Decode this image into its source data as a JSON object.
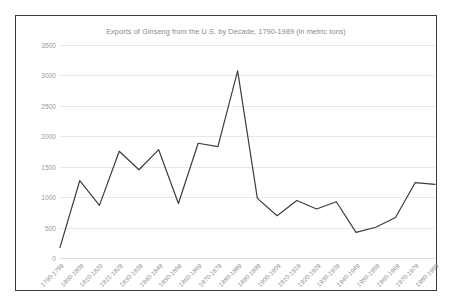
{
  "chart_data": {
    "type": "line",
    "title": "Exports of Ginseng from the U.S. by Decade, 1790-1989 (in metric tons)",
    "xlabel": "",
    "ylabel": "",
    "ylim": [
      0,
      3500
    ],
    "yticks": [
      "0",
      "500",
      "1000",
      "1500",
      "2000",
      "2500",
      "3000",
      "3500"
    ],
    "grid": true,
    "legend": "none",
    "line_color": "#3c3c3c",
    "categories": [
      "1790-1799",
      "1800-1809",
      "1810-1820",
      "1821-1829",
      "1830-1839",
      "1840-1849",
      "1850-1859",
      "1860-1869",
      "1870-1879",
      "1880-1889",
      "1890-1899",
      "1900-1909",
      "1910-1919",
      "1920-1929",
      "1930-1939",
      "1940-1949",
      "1950-1959",
      "1960-1969",
      "1970-1979",
      "1980-1989"
    ],
    "values": [
      175,
      1270,
      865,
      1755,
      1450,
      1780,
      895,
      1885,
      1830,
      3075,
      980,
      695,
      945,
      805,
      925,
      420,
      505,
      665,
      1240,
      1210
    ]
  },
  "title_color": "#8a8a8a",
  "axis_text_color": "#9a9a9a"
}
